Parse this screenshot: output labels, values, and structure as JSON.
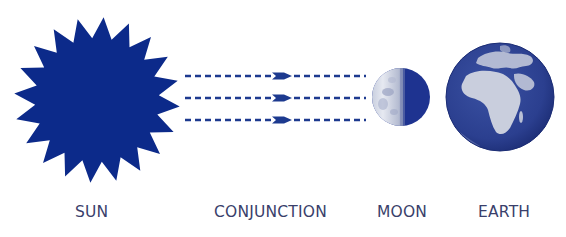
{
  "diagram": {
    "title": "",
    "labels": {
      "sun": "SUN",
      "conjunction": "CONJUNCTION",
      "moon": "MOON",
      "earth": "EARTH"
    },
    "bodies": [
      {
        "name": "Sun",
        "shape": "starburst",
        "points": 20,
        "center": [
          97,
          100
        ],
        "outer_radius": 83,
        "inner_radius": 62,
        "color": "#0c2a8a"
      },
      {
        "name": "Moon",
        "shape": "circle",
        "center": [
          401,
          97
        ],
        "radius": 29,
        "lit_side": "left",
        "lit_color": "#d9dde8",
        "dark_color": "#1e3390"
      },
      {
        "name": "Earth",
        "shape": "globe",
        "center": [
          500,
          97
        ],
        "radius": 54,
        "ocean_color": "#2b3f8f",
        "land_color": "#c9cedd",
        "visible_continents": [
          "Africa",
          "Europe",
          "Arabia"
        ]
      }
    ],
    "rays": {
      "count": 3,
      "style": "dashed",
      "direction": "sun-to-moon",
      "y_positions": [
        76,
        98,
        120
      ],
      "x_start": 185,
      "x_end": 366,
      "arrowhead_x": 272,
      "color": "#1d3a8f"
    },
    "colors": {
      "primary": "#0c2a8a",
      "label": "#3a3f6b",
      "background": "#ffffff"
    }
  }
}
